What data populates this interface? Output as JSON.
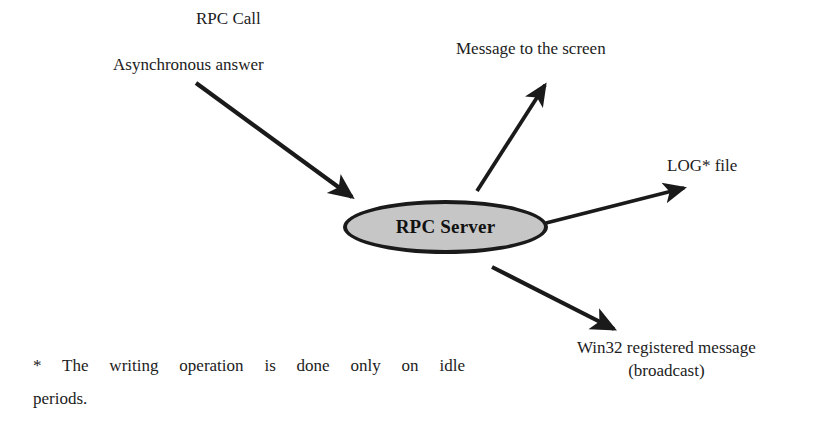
{
  "diagram": {
    "node": {
      "id": "rpc-server",
      "label": "RPC Server",
      "shape": "ellipse",
      "fill_color": "#c6c6c6",
      "border_color": "#1a1a1a"
    },
    "labels": {
      "rpc_call": "RPC Call",
      "async_answer": "Asynchronous answer",
      "message_to_screen": "Message to the screen",
      "log_file": "LOG* file",
      "win32_line1_italic": "Win32",
      "win32_line1_rest": " registered message",
      "win32_line2": "(broadcast)"
    },
    "arrows": [
      {
        "name": "arrow-rpc-call-in",
        "direction": "into-node",
        "from": [
          196,
          83
        ],
        "to": [
          358,
          201
        ]
      },
      {
        "name": "arrow-message-to-screen-out",
        "direction": "out-of-node",
        "from": [
          477,
          191
        ],
        "to": [
          548,
          81
        ]
      },
      {
        "name": "arrow-log-file-out",
        "direction": "out-of-node",
        "from": [
          546,
          223
        ],
        "to": [
          688,
          187
        ]
      },
      {
        "name": "arrow-win32-message-out",
        "direction": "out-of-node",
        "from": [
          492,
          267
        ],
        "to": [
          618,
          332
        ]
      }
    ],
    "footnote": {
      "marker": "*",
      "line1_pre": "The writing operation is done only on ",
      "line1_italic": "idl",
      "line1_post": "e",
      "line2": "periods."
    }
  }
}
